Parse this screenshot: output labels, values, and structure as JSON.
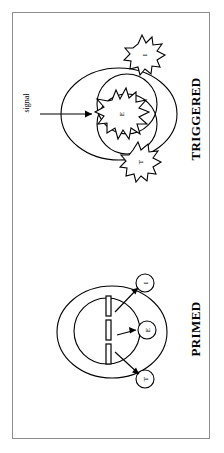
{
  "figure": {
    "background_color": "#ffffff",
    "frame_color": "#8c8c8c",
    "stroke_color": "#000000",
    "orientation_note": "rotated-90-ccw"
  },
  "panels": [
    {
      "id": "triggered",
      "caption": "TRIGGERED",
      "annotation": "signal",
      "nodes": [
        {
          "id": "node-i",
          "letter": "I",
          "shape": "starburst"
        },
        {
          "id": "node-e",
          "letter": "E",
          "shape": "explosion"
        },
        {
          "id": "node-t",
          "letter": "T",
          "shape": "starburst"
        }
      ]
    },
    {
      "id": "primed",
      "caption": "PRIMED",
      "nodes": [
        {
          "id": "node-i",
          "letter": "I",
          "shape": "circle"
        },
        {
          "id": "node-e",
          "letter": "E",
          "shape": "circle"
        },
        {
          "id": "node-t",
          "letter": "T",
          "shape": "circle"
        }
      ]
    }
  ]
}
